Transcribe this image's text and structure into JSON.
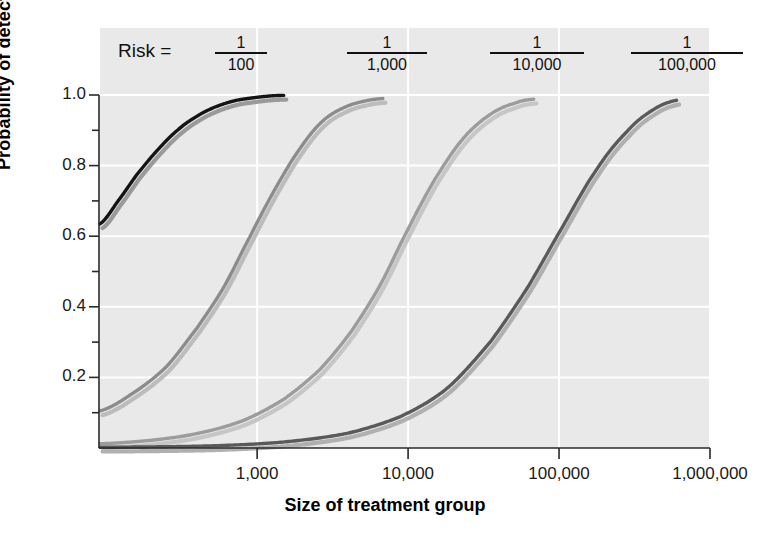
{
  "chart_data": {
    "type": "line",
    "title": "",
    "xlabel": "Size of treatment group",
    "ylabel": "Probability of detection",
    "xscale": "log",
    "xlim": [
      91,
      1000000
    ],
    "ylim": [
      0,
      1.04
    ],
    "grid": true,
    "legend_position": "top-inside",
    "legend_prefix": "Risk =",
    "x_tick_labels": [
      "1,000",
      "10,000",
      "100,000",
      "1,000,000"
    ],
    "x_tick_values": [
      1000,
      10000,
      100000,
      1000000
    ],
    "y_tick_labels": [
      "0.2",
      "0.4",
      "0.6",
      "0.8",
      "1.0"
    ],
    "y_tick_values": [
      0.2,
      0.4,
      0.6,
      0.8,
      1.0
    ],
    "y_minor_ticks": [
      0.1,
      0.3,
      0.5,
      0.7,
      0.9
    ],
    "series": [
      {
        "name": "1/100",
        "numerator": "1",
        "denominator": "100",
        "color": "#141414",
        "shadow_color": "#9a9a9a",
        "x": [
          91,
          120,
          160,
          220,
          300,
          400,
          520,
          700,
          900,
          1200,
          1500
        ],
        "y": [
          0.635,
          0.7,
          0.775,
          0.845,
          0.902,
          0.94,
          0.965,
          0.983,
          0.991,
          0.997,
          0.999
        ]
      },
      {
        "name": "1/1,000",
        "numerator": "1",
        "denominator": "1,000",
        "color": "#8c8c8c",
        "shadow_color": "#bcbcbc",
        "x": [
          91,
          150,
          250,
          400,
          600,
          900,
          1300,
          1900,
          2700,
          3800,
          5200,
          6800
        ],
        "y": [
          0.105,
          0.155,
          0.23,
          0.34,
          0.455,
          0.6,
          0.73,
          0.845,
          0.925,
          0.965,
          0.983,
          0.99
        ]
      },
      {
        "name": "1/10,000",
        "numerator": "1",
        "denominator": "10,000",
        "color": "#9c9c9c",
        "shadow_color": "#c6c6c6",
        "x": [
          91,
          200,
          400,
          800,
          1500,
          2600,
          4200,
          6500,
          10000,
          15000,
          23000,
          35000,
          52000,
          68000
        ],
        "y": [
          0.012,
          0.022,
          0.041,
          0.077,
          0.138,
          0.222,
          0.33,
          0.46,
          0.62,
          0.76,
          0.875,
          0.945,
          0.978,
          0.988
        ]
      },
      {
        "name": "1/100,000",
        "numerator": "1",
        "denominator": "100,000",
        "color": "#5a5a5a",
        "shadow_color": "#b0b0b0",
        "x": [
          91,
          500,
          1500,
          4000,
          9000,
          18000,
          35000,
          62000,
          105000,
          175000,
          280000,
          420000,
          600000
        ],
        "y": [
          0.002,
          0.006,
          0.017,
          0.042,
          0.09,
          0.168,
          0.3,
          0.455,
          0.625,
          0.785,
          0.895,
          0.958,
          0.985
        ]
      }
    ]
  },
  "axes": {
    "y_title": "Probability of detection",
    "x_title": "Size of treatment group"
  }
}
